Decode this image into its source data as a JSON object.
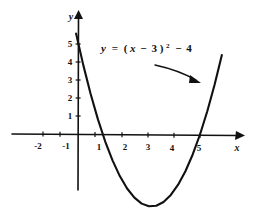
{
  "figure": {
    "title": "",
    "background_color": "#ffffff",
    "ink_color": "#111111"
  },
  "equation": {
    "full_text": "y = (x - 3)² - 4",
    "lhs": "y",
    "equals": "=",
    "open_paren": "(",
    "var": "x",
    "minus_one": "−",
    "h": "3",
    "close_paren": ")",
    "power": "2",
    "minus_two": "−",
    "k": "4"
  },
  "axes": {
    "x_name": "x",
    "y_name": "y",
    "x_ticks": [
      {
        "label": "-2",
        "value": -2
      },
      {
        "label": "-1",
        "value": -1
      },
      {
        "label": "1",
        "value": 1
      },
      {
        "label": "2",
        "value": 2
      },
      {
        "label": "3",
        "value": 3
      },
      {
        "label": "4",
        "value": 4
      },
      {
        "label": "5",
        "value": 5
      }
    ],
    "y_ticks": [
      {
        "label": "1",
        "value": 1
      },
      {
        "label": "2",
        "value": 2
      },
      {
        "label": "3",
        "value": 3
      },
      {
        "label": "4",
        "value": 4
      },
      {
        "label": "5",
        "value": 5
      }
    ]
  },
  "chart_data": {
    "type": "line",
    "title": "",
    "xlabel": "x",
    "ylabel": "y",
    "annotations": [
      {
        "text": "y = (x - 3)² - 4",
        "kind": "curve-label",
        "pointer": "arrow pointing down-right to right branch of parabola"
      }
    ],
    "grid": false,
    "legend": null,
    "xlim": [
      -2.9,
      7.0
    ],
    "ylim": [
      -5.1,
      6.6
    ],
    "series": [
      {
        "name": "y = (x - 3)^2 - 4",
        "equation": "y = (x - 3)^2 - 4",
        "vertex": [
          3,
          -4
        ],
        "roots": [
          1,
          5
        ],
        "y_intercept": 5,
        "x": [
          -0.1,
          0.2,
          0.5,
          0.8,
          1.1,
          1.4,
          1.7,
          2.0,
          2.3,
          2.6,
          2.9,
          3.2,
          3.5,
          3.8,
          4.1,
          4.4,
          4.7,
          5.0,
          5.3,
          5.6,
          5.9
        ],
        "values": [
          5.61,
          3.84,
          2.25,
          0.84,
          -0.39,
          -1.44,
          -2.31,
          -3.0,
          -3.51,
          -3.84,
          -3.99,
          -3.96,
          -3.75,
          -3.36,
          -2.79,
          -2.04,
          -1.11,
          0.0,
          1.29,
          2.76,
          4.41
        ]
      }
    ]
  }
}
